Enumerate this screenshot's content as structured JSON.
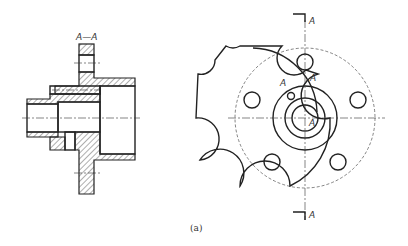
{
  "section_view": {
    "label": "A—A"
  },
  "front_view": {
    "labels": [
      "A",
      "A",
      "A",
      "A",
      "A"
    ]
  },
  "caption": "(a)"
}
